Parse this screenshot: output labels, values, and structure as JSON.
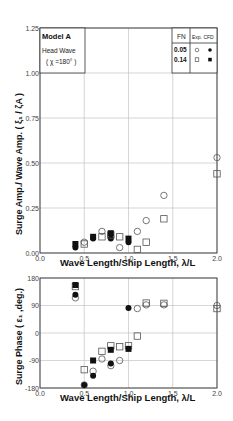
{
  "chart_data": [
    {
      "type": "scatter",
      "title": "",
      "xlabel": "Wave Length/Ship Length,  λ/L",
      "ylabel": "Surge Amp./ Wave Amp. ( ξ1 / ζA )",
      "xlim": [
        0.0,
        2.0
      ],
      "ylim": [
        0.0,
        1.25
      ],
      "x_ticks": [
        "0.0",
        "0.5",
        "1.0",
        "1.5",
        "2.0"
      ],
      "y_ticks": [
        "0.00",
        "0.25",
        "0.50",
        "0.75",
        "1.00",
        "1.25"
      ],
      "grid": true,
      "annotation": {
        "model": "Model A",
        "wave": "Head Wave",
        "heading": "( χ =180° )"
      },
      "legend": {
        "position": "top-right",
        "header": {
          "fn": "F_N",
          "exp": "Exp.",
          "cfd": "CFD"
        },
        "rows": [
          {
            "fn": "0.05",
            "exp_marker": "open-circle",
            "cfd_marker": "filled-circle"
          },
          {
            "fn": "0.14",
            "exp_marker": "open-square",
            "cfd_marker": "filled-square"
          }
        ]
      },
      "series": [
        {
          "name": "Fn=0.05 Exp.",
          "marker": "open-circle",
          "x": [
            0.5,
            0.7,
            0.8,
            0.9,
            1.1,
            1.2,
            1.4,
            2.0
          ],
          "y": [
            0.06,
            0.12,
            0.09,
            0.03,
            0.12,
            0.18,
            0.32,
            0.53
          ]
        },
        {
          "name": "Fn=0.05 CFD",
          "marker": "filled-circle",
          "x": [
            0.4,
            0.6,
            0.8,
            1.0
          ],
          "y": [
            0.03,
            0.08,
            0.08,
            0.06
          ]
        },
        {
          "name": "Fn=0.14 Exp.",
          "marker": "open-square",
          "x": [
            0.5,
            0.7,
            0.8,
            0.9,
            1.1,
            1.2,
            1.4,
            2.0
          ],
          "y": [
            0.05,
            0.09,
            0.1,
            0.09,
            0.02,
            0.06,
            0.19,
            0.44
          ]
        },
        {
          "name": "Fn=0.14 CFD",
          "marker": "filled-square",
          "x": [
            0.4,
            0.6,
            0.8,
            1.0
          ],
          "y": [
            0.05,
            0.09,
            0.11,
            0.08
          ]
        }
      ]
    },
    {
      "type": "scatter",
      "title": "",
      "xlabel": "Wave Length/Ship Length,  λ/L",
      "ylabel": "Surge Phase ( ε1 ,deg.)",
      "xlim": [
        0.0,
        2.0
      ],
      "ylim": [
        -180,
        180
      ],
      "x_ticks": [
        "0.0",
        "0.5",
        "1.0",
        "1.5",
        "2.0"
      ],
      "y_ticks": [
        "-180",
        "-90",
        "0",
        "90",
        "180"
      ],
      "grid": true,
      "series": [
        {
          "name": "Fn=0.05 Exp.",
          "marker": "open-circle",
          "x": [
            0.4,
            0.5,
            0.6,
            0.7,
            0.8,
            0.9,
            1.1,
            1.2,
            1.4,
            2.0
          ],
          "y": [
            115,
            -170,
            -125,
            -85,
            -107,
            -90,
            80,
            92,
            92,
            90
          ]
        },
        {
          "name": "Fn=0.05 CFD",
          "marker": "filled-circle",
          "x": [
            0.4,
            0.5,
            0.6,
            0.8,
            1.0
          ],
          "y": [
            125,
            -170,
            -140,
            -100,
            82
          ]
        },
        {
          "name": "Fn=0.14 Exp.",
          "marker": "open-square",
          "x": [
            0.4,
            0.5,
            0.7,
            0.8,
            0.9,
            1.0,
            1.1,
            1.2,
            1.4,
            2.0
          ],
          "y": [
            152,
            -120,
            -60,
            -42,
            -45,
            -42,
            -10,
            98,
            97,
            80
          ]
        },
        {
          "name": "Fn=0.14 CFD",
          "marker": "filled-square",
          "x": [
            0.4,
            0.6,
            0.8,
            1.0
          ],
          "y": [
            157,
            -90,
            -55,
            -52
          ]
        }
      ]
    }
  ],
  "labels": {
    "top_xlabel": "Wave Length/Ship Length,  λ/L",
    "bottom_xlabel": "Wave Length/Ship Length,  λ/L",
    "top_ylabel": "Surge Amp./ Wave Amp. ( ξ₁ / ζA )",
    "bottom_ylabel": "Surge Phase ( ε₁ ,deg.)",
    "model": "Model A",
    "wave": "Head Wave",
    "heading": "( χ =180° )",
    "legend_fn": "FN",
    "legend_exp_cfd": "Exp. CFD",
    "legend_fn1": "0.05",
    "legend_fn2": "0.14"
  }
}
